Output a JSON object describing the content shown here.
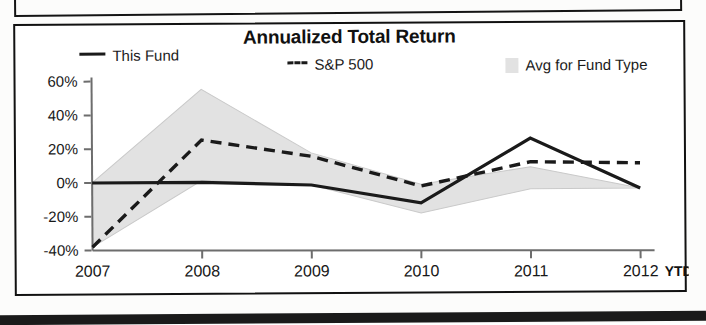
{
  "chart_data": {
    "type": "line",
    "title": "Annualized Total Return",
    "xlabel": "",
    "ylabel": "",
    "categories": [
      "2007",
      "2008",
      "2009",
      "2010",
      "2011",
      "2012"
    ],
    "x_tick_suffix": "YTD",
    "ylim": [
      -40,
      60
    ],
    "yticks": [
      60,
      40,
      20,
      0,
      -20,
      -40
    ],
    "ytick_labels": [
      "60%",
      "40%",
      "20%",
      "0%",
      "-20%",
      "-40%"
    ],
    "grid": false,
    "legend_position": "top",
    "series": [
      {
        "name": "This Fund",
        "style": "solid",
        "color": "#1a1a1a",
        "values": [
          0,
          0,
          -2,
          -13,
          25,
          -5
        ]
      },
      {
        "name": "S&P 500",
        "style": "dashed",
        "color": "#1a1a1a",
        "values": [
          -38,
          25,
          15,
          -3,
          11,
          10
        ]
      },
      {
        "name": "Avg for Fund Type",
        "style": "band",
        "color": "#e2e2e2",
        "upper": [
          0,
          55,
          17,
          -2,
          8,
          -5
        ],
        "lower": [
          -38,
          1,
          -2,
          -19,
          -5,
          -5
        ]
      }
    ]
  },
  "legend": {
    "items": [
      {
        "label": "This Fund",
        "marker": "solid-line-swatch"
      },
      {
        "label": "S&P 500",
        "marker": "dashed-line-swatch"
      },
      {
        "label": "Avg for Fund Type",
        "marker": "area-swatch"
      }
    ]
  },
  "colors": {
    "line": "#1a1a1a",
    "band": "#e2e2e2",
    "axis": "#555555",
    "frame": "#111111"
  }
}
